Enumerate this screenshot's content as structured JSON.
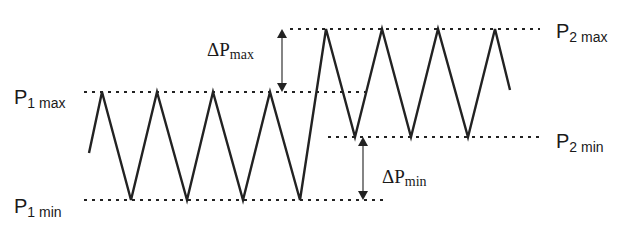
{
  "labels": {
    "p1_max": {
      "main": "P",
      "sub": "1 max"
    },
    "p1_min": {
      "main": "P",
      "sub": "1 min"
    },
    "p2_max": {
      "main": "P",
      "sub": "2 max"
    },
    "p2_min": {
      "main": "P",
      "sub": "2 min"
    },
    "delta_p_max": {
      "main": "ΔP",
      "sub": "max"
    },
    "delta_p_min": {
      "main": "ΔP",
      "sub": "min"
    }
  },
  "levels": {
    "p1_max_y": 92,
    "p1_min_y": 200,
    "p2_max_y": 29,
    "p2_min_y": 137
  },
  "waveform": {
    "segment_1": {
      "level": "P1",
      "peaks": 4,
      "troughs": 4
    },
    "segment_2": {
      "level": "P2",
      "peaks": 4,
      "troughs": 3
    }
  },
  "colors": {
    "line": "#222222",
    "background": "#ffffff"
  }
}
